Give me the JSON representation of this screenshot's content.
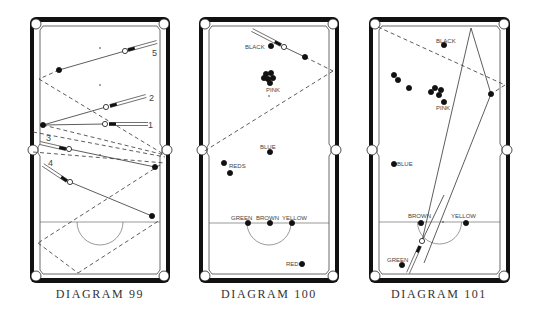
{
  "colors": {
    "ink": "#111111",
    "line": "#333333",
    "cloth": "#ffffff",
    "label": "#555555"
  },
  "diagrams": [
    {
      "id": "d99",
      "caption": "DIAGRAM 99",
      "table": {
        "x": 30,
        "y": 17,
        "w": 140,
        "h": 266
      },
      "baulk_y": 222,
      "d_radius": 23,
      "spots": [
        [
          100,
          48
        ],
        [
          100,
          85
        ],
        [
          100,
          155
        ]
      ],
      "balls": [
        {
          "x": 59,
          "y": 70,
          "fill": "#111"
        },
        {
          "x": 125,
          "y": 51,
          "fill": "#fff"
        },
        {
          "x": 43,
          "y": 125,
          "fill": "#111"
        },
        {
          "x": 106,
          "y": 107,
          "fill": "#fff"
        },
        {
          "x": 105,
          "y": 124,
          "fill": "#fff"
        },
        {
          "x": 69,
          "y": 149,
          "fill": "#fff"
        },
        {
          "x": 155,
          "y": 167,
          "fill": "#111"
        },
        {
          "x": 70,
          "y": 182,
          "fill": "#fff"
        },
        {
          "x": 152,
          "y": 216,
          "fill": "#111"
        }
      ],
      "solid_lines": [
        [
          59,
          70,
          125,
          51
        ],
        [
          43,
          125,
          106,
          107
        ],
        [
          43,
          125,
          105,
          124
        ],
        [
          69,
          149,
          155,
          167
        ],
        [
          70,
          182,
          152,
          216
        ]
      ],
      "dashed_lines": [
        [
          59,
          70,
          39,
          79
        ],
        [
          39,
          79,
          165,
          155
        ],
        [
          43,
          125,
          165,
          155
        ],
        [
          33,
          132,
          165,
          157
        ],
        [
          33,
          152,
          165,
          163
        ],
        [
          160,
          165,
          38,
          243
        ],
        [
          38,
          243,
          78,
          273
        ],
        [
          78,
          273,
          160,
          220
        ]
      ],
      "cues": [
        {
          "x1": 157,
          "y1": 42,
          "x2": 128,
          "y2": 50
        },
        {
          "x1": 146,
          "y1": 96,
          "x2": 110,
          "y2": 106
        },
        {
          "x1": 148,
          "y1": 124,
          "x2": 109,
          "y2": 124
        },
        {
          "x1": 40,
          "y1": 143,
          "x2": 66,
          "y2": 149
        },
        {
          "x1": 43,
          "y1": 165,
          "x2": 67,
          "y2": 181
        }
      ],
      "labels": [
        {
          "text": "5",
          "x": 152,
          "y": 56,
          "size": 9
        },
        {
          "text": "2",
          "x": 149,
          "y": 101,
          "size": 9
        },
        {
          "text": "1",
          "x": 148,
          "y": 128,
          "size": 9
        },
        {
          "text": "3",
          "x": 46,
          "y": 141,
          "size": 9
        },
        {
          "text": "4",
          "x": 48,
          "y": 166,
          "size": 9
        }
      ]
    },
    {
      "id": "d100",
      "caption": "DIAGRAM 100",
      "table": {
        "x": 199,
        "y": 17,
        "w": 140,
        "h": 266
      },
      "baulk_y": 223,
      "d_radius": 22,
      "spots": [
        [
          269,
          96
        ]
      ],
      "balls": [
        {
          "x": 271,
          "y": 46,
          "fill": "#111",
          "label": "BLACK"
        },
        {
          "x": 284,
          "y": 47,
          "fill": "#fff"
        },
        {
          "x": 305,
          "y": 57,
          "fill": "#111"
        },
        {
          "x": 266,
          "y": 74,
          "fill": "#111"
        },
        {
          "x": 271,
          "y": 73,
          "fill": "#111"
        },
        {
          "x": 264,
          "y": 78,
          "fill": "#111"
        },
        {
          "x": 268,
          "y": 79,
          "fill": "#111"
        },
        {
          "x": 273,
          "y": 78,
          "fill": "#111"
        },
        {
          "x": 270,
          "y": 83,
          "fill": "#111",
          "label": "PINK"
        },
        {
          "x": 270,
          "y": 152,
          "fill": "#111",
          "label": "BLUE"
        },
        {
          "x": 224,
          "y": 163,
          "fill": "#111"
        },
        {
          "x": 230,
          "y": 173,
          "fill": "#111",
          "label": "REDS"
        },
        {
          "x": 248,
          "y": 223,
          "fill": "#111",
          "label": "GREEN"
        },
        {
          "x": 270,
          "y": 223,
          "fill": "#111",
          "label": "BROWN"
        },
        {
          "x": 292,
          "y": 223,
          "fill": "#111",
          "label": "YELLOW"
        },
        {
          "x": 302,
          "y": 264,
          "fill": "#111",
          "label": "RED"
        }
      ],
      "solid_lines": [
        [
          284,
          47,
          305,
          57
        ]
      ],
      "dashed_lines": [
        [
          305,
          57,
          333,
          71
        ],
        [
          333,
          71,
          203,
          152
        ]
      ],
      "cues": [
        {
          "x1": 252,
          "y1": 30,
          "x2": 281,
          "y2": 45
        }
      ],
      "labels": [
        {
          "text": "BLACK",
          "x": 245,
          "y": 49,
          "size": 6
        },
        {
          "text": "PINK",
          "x": 266,
          "y": 92,
          "size": 6
        },
        {
          "text": "BLUE",
          "x": 260,
          "y": 149,
          "size": 6
        },
        {
          "text": "REDS",
          "x": 229,
          "y": 168,
          "size": 6
        },
        {
          "text": "GREEN",
          "x": 231,
          "y": 220,
          "size": 6
        },
        {
          "text": "BROWN",
          "x": 256,
          "y": 220,
          "size": 6
        },
        {
          "text": "YELLOW",
          "x": 282,
          "y": 220,
          "size": 6
        },
        {
          "text": "RED",
          "x": 286,
          "y": 266,
          "size": 6
        }
      ]
    },
    {
      "id": "d101",
      "caption": "DIAGRAM 101",
      "table": {
        "x": 369,
        "y": 17,
        "w": 141,
        "h": 266
      },
      "baulk_y": 222,
      "d_radius": 22,
      "spots": [
        [
          443,
          222
        ]
      ],
      "balls": [
        {
          "x": 444,
          "y": 45,
          "fill": "#111",
          "label": "BLACK"
        },
        {
          "x": 394,
          "y": 75,
          "fill": "#111"
        },
        {
          "x": 398,
          "y": 80,
          "fill": "#111"
        },
        {
          "x": 409,
          "y": 88,
          "fill": "#111"
        },
        {
          "x": 431,
          "y": 92,
          "fill": "#111"
        },
        {
          "x": 435,
          "y": 88,
          "fill": "#111"
        },
        {
          "x": 441,
          "y": 90,
          "fill": "#111"
        },
        {
          "x": 439,
          "y": 95,
          "fill": "#111"
        },
        {
          "x": 444,
          "y": 102,
          "fill": "#111",
          "label": "PINK"
        },
        {
          "x": 491,
          "y": 94,
          "fill": "#111"
        },
        {
          "x": 394,
          "y": 164,
          "fill": "#111",
          "label": "BLUE"
        },
        {
          "x": 421,
          "y": 223,
          "fill": "#111",
          "label": "BROWN"
        },
        {
          "x": 466,
          "y": 223,
          "fill": "#111",
          "label": "YELLOW"
        },
        {
          "x": 422,
          "y": 241,
          "fill": "#fff"
        },
        {
          "x": 402,
          "y": 265,
          "fill": "#111",
          "label": "GREEN"
        }
      ],
      "solid_lines": [
        [
          422,
          241,
          471,
          28
        ],
        [
          471,
          28,
          491,
          94
        ],
        [
          491,
          94,
          424,
          263
        ],
        [
          422,
          241,
          444,
          195
        ]
      ],
      "dashed_lines": [
        [
          378,
          27,
          505,
          85
        ],
        [
          505,
          85,
          491,
          94
        ]
      ],
      "cues": [
        {
          "x1": 408,
          "y1": 273,
          "x2": 420,
          "y2": 246
        }
      ],
      "labels": [
        {
          "text": "BLACK",
          "x": 436,
          "y": 43,
          "size": 6
        },
        {
          "text": "PINK",
          "x": 436,
          "y": 110,
          "size": 6
        },
        {
          "text": "BLUE",
          "x": 397,
          "y": 166,
          "size": 6
        },
        {
          "text": "BROWN",
          "x": 408,
          "y": 218,
          "size": 6
        },
        {
          "text": "YELLOW",
          "x": 451,
          "y": 218,
          "size": 6
        },
        {
          "text": "GREEN",
          "x": 387,
          "y": 262,
          "size": 6
        }
      ]
    }
  ]
}
